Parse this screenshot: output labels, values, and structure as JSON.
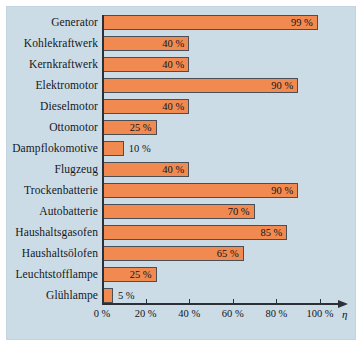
{
  "figure": {
    "background_color": "#ffffff",
    "panel_color": "#ccdce6",
    "bar_color": "#f18a51",
    "bar_border_color": "#4b4f55",
    "axis_color": "#2b3036",
    "axis_symbol": "η"
  },
  "chart_data": {
    "type": "bar",
    "orientation": "horizontal",
    "title": "",
    "xlabel": "η",
    "ylabel": "",
    "xlim": [
      0,
      100
    ],
    "grid": false,
    "legend": null,
    "tick_labels": [
      "0 %",
      "20 %",
      "40 %",
      "60 %",
      "80 %",
      "100 %"
    ],
    "tick_values": [
      0,
      20,
      40,
      60,
      80,
      100
    ],
    "categories": [
      "Generator",
      "Kohlekraftwerk",
      "Kernkraftwerk",
      "Elektromotor",
      "Dieselmotor",
      "Ottomotor",
      "Dampflokomotive",
      "Flugzeug",
      "Trockenbatterie",
      "Autobatterie",
      "Haushaltsgasofen",
      "Haushaltsölofen",
      "Leuchtstofflampe",
      "Glühlampe"
    ],
    "values": [
      99,
      40,
      40,
      90,
      40,
      25,
      10,
      40,
      90,
      70,
      85,
      65,
      25,
      5
    ],
    "value_labels": [
      "99 %",
      "40 %",
      "40 %",
      "90 %",
      "40 %",
      "25 %",
      "10 %",
      "40 %",
      "90 %",
      "70 %",
      "85 %",
      "65 %",
      "25 %",
      "5 %"
    ],
    "label_placement": [
      "inside",
      "inside",
      "inside",
      "inside",
      "inside",
      "inside",
      "outside",
      "inside",
      "inside",
      "inside",
      "inside",
      "inside",
      "inside",
      "outside"
    ]
  }
}
